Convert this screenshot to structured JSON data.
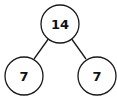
{
  "diagram": {
    "type": "number-bond",
    "root": {
      "value": "14"
    },
    "children": [
      {
        "value": "7"
      },
      {
        "value": "7"
      }
    ],
    "colors": {
      "stroke": "#1a1a1a",
      "fill": "#ffffff",
      "text": "#111111"
    }
  }
}
